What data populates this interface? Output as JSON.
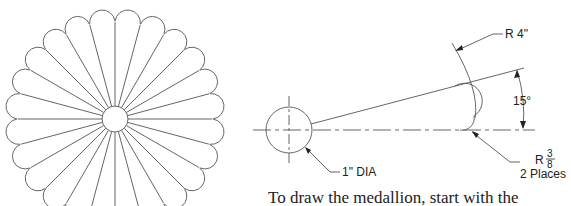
{
  "medallion": {
    "center": [
      115,
      119
    ],
    "inner_radius": 13,
    "outer_radius": 110,
    "petal_count": 24,
    "stroke": "#666666"
  },
  "detail": {
    "labels": {
      "r4": "R 4\"",
      "angle": "15°",
      "dia": "1\" DIA",
      "r38_prefix": "R",
      "r38_num": "3",
      "r38_den": "8",
      "places": "2 Places"
    }
  },
  "caption": "To draw the medallion, start with the"
}
